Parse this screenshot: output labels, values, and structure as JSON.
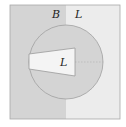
{
  "diagram": {
    "regions": [
      {
        "id": "left-half",
        "label": "B",
        "fill": "#d4d4d4"
      },
      {
        "id": "right-half",
        "label": "L",
        "fill": "#ececec"
      },
      {
        "id": "circle",
        "fill": "#d4d4d4"
      },
      {
        "id": "wedge",
        "label": "L",
        "fill": "#f2f2f2"
      }
    ],
    "labels": {
      "top_left": "B",
      "top_right": "L",
      "wedge": "L"
    },
    "colors": {
      "dark_region": "#d4d4d4",
      "light_region": "#ececec",
      "wedge": "#f2f2f2",
      "border": "#9a9a9a"
    }
  }
}
